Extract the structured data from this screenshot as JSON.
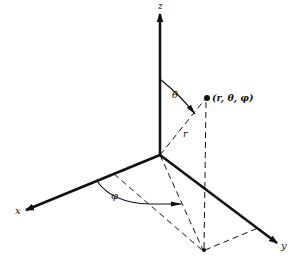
{
  "diagram": {
    "axes": {
      "x": "x",
      "y": "y",
      "z": "z"
    },
    "point_label": "(r, θ, φ)",
    "radius_label": "r",
    "polar_angle_label": "θ",
    "azimuth_angle_label": "φ",
    "colors": {
      "ink": "#111111",
      "background": "#ffffff"
    }
  }
}
